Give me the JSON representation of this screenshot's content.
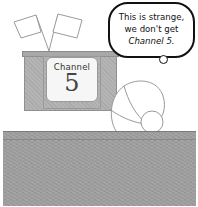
{
  "scene": {
    "description": "Cartoon of a person seen from behind looking at a TV with antenna flags",
    "tv": {
      "screen_label": "Channel",
      "screen_number": "5"
    },
    "speech_bubble": {
      "lines": [
        "This is strange,",
        "we don't get",
        "Channel 5."
      ]
    },
    "colors": {
      "tv_body": "#b4b4b4",
      "table": "#a0a0a0",
      "bubble_border": "#111111",
      "background": "#ffffff"
    }
  }
}
